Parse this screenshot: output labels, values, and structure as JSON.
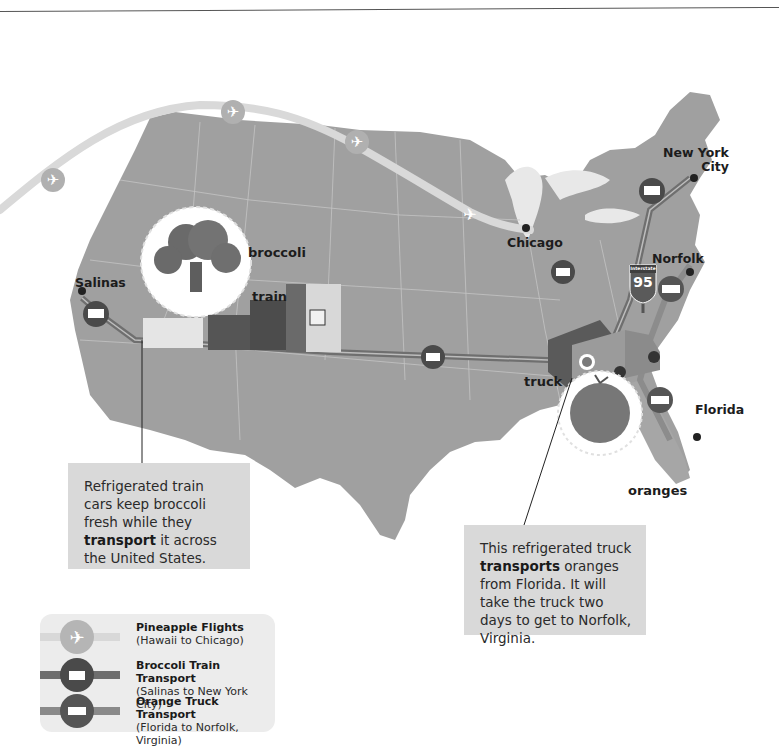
{
  "page": {
    "number_fragment": "1"
  },
  "map": {
    "land_color": "#9e9e9e",
    "ocean_color": "#ffffff",
    "cities": [
      {
        "name": "Salinas"
      },
      {
        "name": "Chicago"
      },
      {
        "name": "New York City",
        "line1": "New York",
        "line2": "City"
      },
      {
        "name": "Norfolk"
      },
      {
        "name": "Florida"
      }
    ],
    "labels": {
      "broccoli": "broccoli",
      "train": "train",
      "truck": "truck",
      "oranges": "oranges"
    },
    "interstate_sign": {
      "top": "Interstate",
      "number": "95"
    }
  },
  "callouts": {
    "train": {
      "pre": "Refrigerated train cars keep broccoli fresh while they ",
      "bold": "transport",
      "post": " it across the United States."
    },
    "truck": {
      "pre": "This refrigerated truck ",
      "bold": "transports",
      "post": " oranges from Florida. It will take the truck two days to get to Norfolk, Virginia."
    }
  },
  "legend": {
    "items": [
      {
        "title": "Pineapple Flights",
        "subtitle": "(Hawaii to Chicago)",
        "icon": "airplane-icon",
        "line_color": "#d8d8d8",
        "circle_color": "#b5b5b5"
      },
      {
        "title": "Broccoli Train Transport",
        "subtitle": "(Salinas to New York City)",
        "icon": "train-icon",
        "line_color": "#6e6e6e",
        "circle_color": "#4a4a4a"
      },
      {
        "title": "Orange Truck Transport",
        "subtitle": "(Florida to Norfolk, Virginia)",
        "icon": "truck-icon",
        "line_color": "#8a8a8a",
        "circle_color": "#555555"
      }
    ]
  },
  "colors": {
    "flight_path": "#d9d9d9",
    "train_path": "#6f6f6f",
    "truck_path": "#8c8c8c",
    "callout_bg": "#d9d9d9",
    "legend_bg": "#ececec"
  }
}
